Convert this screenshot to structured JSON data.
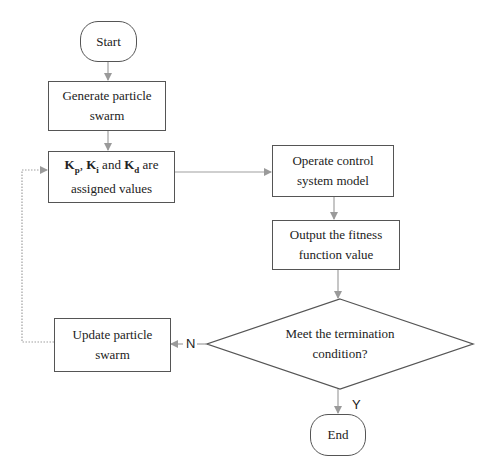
{
  "diagram": {
    "type": "flowchart",
    "nodes": {
      "start": {
        "label": "Start"
      },
      "generate": {
        "line1": "Generate particle",
        "line2": "swarm"
      },
      "assign": {
        "k1": "K",
        "k1_sub": "p",
        "sep1": ", ",
        "k2": "K",
        "k2_sub": "i",
        "sep2": " and ",
        "k3": "K",
        "k3_sub": "d",
        "tail": " are",
        "line2": "assigned values"
      },
      "operate": {
        "line1": "Operate control",
        "line2": "system model"
      },
      "output": {
        "line1": "Output the fitness",
        "line2": "function value"
      },
      "decision": {
        "line1": "Meet the termination",
        "line2": "condition?"
      },
      "update": {
        "line1": "Update particle",
        "line2": "swarm"
      },
      "end": {
        "label": "End"
      }
    },
    "edge_labels": {
      "no": "N",
      "yes": "Y"
    },
    "colors": {
      "line": "#a0a0a0",
      "border": "#555555",
      "text": "#222222"
    }
  }
}
